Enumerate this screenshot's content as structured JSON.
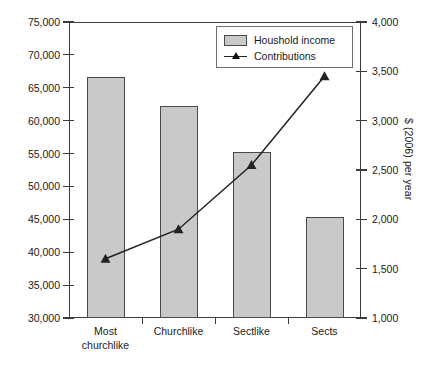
{
  "chart_data": {
    "type": "bar",
    "title": "",
    "subtitle": "",
    "categories": [
      "Most churchlike",
      "Churchlike",
      "Sectlike",
      "Sects"
    ],
    "category_lines": [
      [
        "Most",
        "churchlike"
      ],
      [
        "Churchlike"
      ],
      [
        "Sectlike"
      ],
      [
        "Sects"
      ]
    ],
    "xlabel": "",
    "ylabel": "$ (2006) per year",
    "ylabel_right": "$ (2006) per year",
    "ylim": [
      30000,
      75000
    ],
    "ylim_right": [
      1000,
      4000
    ],
    "yticks": [
      30000,
      35000,
      40000,
      45000,
      50000,
      55000,
      60000,
      65000,
      70000,
      75000
    ],
    "ytick_labels": [
      "30,000",
      "35,000",
      "40,000",
      "45,000",
      "50,000",
      "55,000",
      "60,000",
      "65,000",
      "70,000",
      "75,000"
    ],
    "yticks_right": [
      1000,
      1500,
      2000,
      2500,
      3000,
      3500,
      4000
    ],
    "ytick_labels_right": [
      "1,000",
      "1,500",
      "2,000",
      "2,500",
      "3,000",
      "3,500",
      "4,000"
    ],
    "grid": false,
    "legend_position": "top-right",
    "series": [
      {
        "name": "Houshold income",
        "type": "bar",
        "axis": "left",
        "values": [
          66700,
          62200,
          55300,
          45300
        ],
        "color": "#c9c9c9",
        "edge_color": "#4a4a4a"
      },
      {
        "name": "Contributions",
        "type": "line",
        "axis": "right",
        "values": [
          1600,
          1900,
          2550,
          3450
        ],
        "color": "#222222",
        "marker": "triangle"
      }
    ]
  },
  "legend": {
    "items": [
      {
        "label": "Houshold income",
        "marker": "bar-swatch"
      },
      {
        "label": "Contributions",
        "marker": "line-triangle"
      }
    ]
  },
  "axes": {
    "left_title": "$ (2006) per year",
    "right_title": "$ (2006) per year"
  },
  "colors": {
    "bar_fill": "#c9c9c9",
    "bar_edge": "#4a4a4a",
    "line": "#222222",
    "frame": "#3c3c3c",
    "text": "#1a1a1a",
    "background": "#ffffff"
  }
}
